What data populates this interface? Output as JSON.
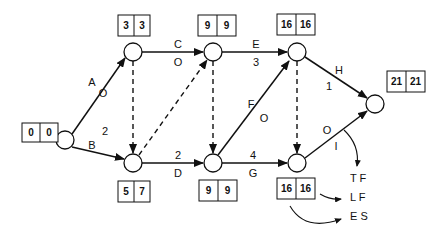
{
  "diagram": {
    "type": "activity-on-arrow network",
    "nodes": [
      {
        "id": "n1",
        "es": "0",
        "lf": "0"
      },
      {
        "id": "n2",
        "es": "3",
        "lf": "3"
      },
      {
        "id": "n3",
        "es": "9",
        "lf": "9"
      },
      {
        "id": "n4",
        "es": "16",
        "lf": "16"
      },
      {
        "id": "n5",
        "es": "21",
        "lf": "21"
      },
      {
        "id": "n6",
        "es": "5",
        "lf": "7"
      },
      {
        "id": "n7",
        "es": "9",
        "lf": "9"
      },
      {
        "id": "n8",
        "es": "16",
        "lf": "16"
      }
    ],
    "activities": [
      {
        "name": "A",
        "float": "O"
      },
      {
        "name": "B",
        "float": "2"
      },
      {
        "name": "C",
        "float": "O"
      },
      {
        "name": "D",
        "float": "2"
      },
      {
        "name": "E",
        "float": "3"
      },
      {
        "name": "F",
        "float": "O"
      },
      {
        "name": "G",
        "float": "4"
      },
      {
        "name": "H",
        "float": "1"
      },
      {
        "name": "I",
        "float": "O"
      }
    ],
    "legend": {
      "tf": "T F",
      "lf": "L F",
      "es": "E S",
      "box_left": "16",
      "box_right": "16"
    }
  }
}
